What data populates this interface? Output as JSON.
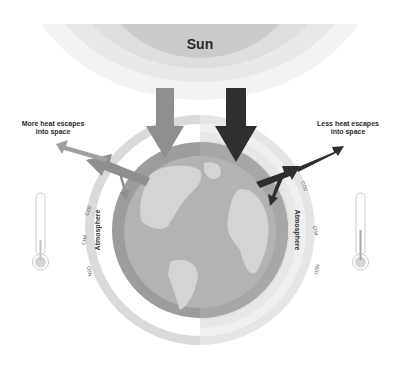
{
  "sun": {
    "label": "Sun"
  },
  "left_panel": {
    "caption_line1": "More heat escapes",
    "caption_line2": "into space",
    "atmosphere_label": "Atmosphere",
    "gases": [
      "CO2",
      "CH4",
      "N2O"
    ]
  },
  "right_panel": {
    "caption_line1": "Less heat escapes",
    "caption_line2": "into space",
    "atmosphere_label": "Atmosphere",
    "gases": [
      "CO2",
      "CH4",
      "N2O"
    ]
  },
  "colors": {
    "sun_core": "#c9c9c9",
    "sun_ring1": "#dcdcdc",
    "sun_ring2": "#ececec",
    "left_arrow": "#8e8e8e",
    "right_arrow": "#2e2e2e",
    "earth_ring": "#9c9c9c",
    "ocean": "#a8a8a8",
    "land": "#d2d2d2",
    "atmos_left": "#d9d9d9",
    "atmos_right": "#e4e4e4"
  }
}
